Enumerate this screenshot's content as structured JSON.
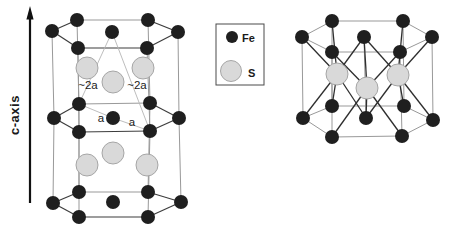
{
  "figure": {
    "canvas": {
      "width": 452,
      "height": 231,
      "background": "#ffffff"
    },
    "colors": {
      "fe_fill": "#1f1f1f",
      "s_fill": "#d9d9d9",
      "s_stroke": "#a6a6a6",
      "bond_dark": "#3d3d3d",
      "bond_gray": "#999999",
      "bond_thin": "#b5b5b5",
      "sbond_dark": "#2e2e2e",
      "arrow": "#111111",
      "text": "#1a1a1a",
      "legend_border": "#4a4a4a"
    },
    "radii": {
      "fe": 7,
      "s": 11,
      "legend_fe": 6,
      "legend_s": 10.5
    },
    "axis": {
      "label": "c-axis"
    },
    "annotations": [
      {
        "text": "~2a"
      },
      {
        "text": "~2a"
      },
      {
        "text": "a"
      },
      {
        "text": "a"
      }
    ],
    "legend": {
      "items": [
        {
          "label": "Fe",
          "element": "fe"
        },
        {
          "label": "S",
          "element": "s"
        }
      ]
    },
    "left_structure": {
      "atoms": [
        {
          "id": "t-bl",
          "el": "fe",
          "x": 77,
          "y": 20
        },
        {
          "id": "t-br",
          "el": "fe",
          "x": 148,
          "y": 20
        },
        {
          "id": "t-l",
          "el": "fe",
          "x": 52,
          "y": 31
        },
        {
          "id": "t-c",
          "el": "fe",
          "x": 112,
          "y": 32
        },
        {
          "id": "t-r",
          "el": "fe",
          "x": 178,
          "y": 32
        },
        {
          "id": "t-fl",
          "el": "fe",
          "x": 78,
          "y": 48
        },
        {
          "id": "t-fr",
          "el": "fe",
          "x": 147,
          "y": 48
        },
        {
          "id": "s1-l",
          "el": "s",
          "x": 87,
          "y": 68
        },
        {
          "id": "s1-r",
          "el": "s",
          "x": 143,
          "y": 68
        },
        {
          "id": "s1-c",
          "el": "s",
          "x": 113,
          "y": 82
        },
        {
          "id": "m-bl",
          "el": "fe",
          "x": 79,
          "y": 104
        },
        {
          "id": "m-br",
          "el": "fe",
          "x": 150,
          "y": 103
        },
        {
          "id": "m-l",
          "el": "fe",
          "x": 54,
          "y": 118
        },
        {
          "id": "m-c",
          "el": "fe",
          "x": 113,
          "y": 118
        },
        {
          "id": "m-r",
          "el": "fe",
          "x": 179,
          "y": 118
        },
        {
          "id": "m-fl",
          "el": "fe",
          "x": 79,
          "y": 132
        },
        {
          "id": "m-fr",
          "el": "fe",
          "x": 150,
          "y": 131
        },
        {
          "id": "s2-c",
          "el": "s",
          "x": 113,
          "y": 153
        },
        {
          "id": "s2-l",
          "el": "s",
          "x": 87,
          "y": 165
        },
        {
          "id": "s2-r",
          "el": "s",
          "x": 147,
          "y": 165
        },
        {
          "id": "b-bl",
          "el": "fe",
          "x": 79,
          "y": 192
        },
        {
          "id": "b-br",
          "el": "fe",
          "x": 148,
          "y": 192
        },
        {
          "id": "b-l",
          "el": "fe",
          "x": 53,
          "y": 203
        },
        {
          "id": "b-c",
          "el": "fe",
          "x": 113,
          "y": 202
        },
        {
          "id": "b-r",
          "el": "fe",
          "x": 181,
          "y": 202
        },
        {
          "id": "b-fl",
          "el": "fe",
          "x": 79,
          "y": 217
        },
        {
          "id": "b-fr",
          "el": "fe",
          "x": 148,
          "y": 217
        }
      ],
      "bonds": [
        {
          "a": "t-l",
          "b": "t-bl",
          "tone": "dark"
        },
        {
          "a": "t-bl",
          "b": "t-br",
          "tone": "gray"
        },
        {
          "a": "t-br",
          "b": "t-r",
          "tone": "dark"
        },
        {
          "a": "t-r",
          "b": "t-fr",
          "tone": "dark"
        },
        {
          "a": "t-fr",
          "b": "t-fl",
          "tone": "dark"
        },
        {
          "a": "t-fl",
          "b": "t-l",
          "tone": "dark"
        },
        {
          "a": "m-l",
          "b": "m-bl",
          "tone": "dark"
        },
        {
          "a": "m-bl",
          "b": "m-br",
          "tone": "gray"
        },
        {
          "a": "m-br",
          "b": "m-r",
          "tone": "dark"
        },
        {
          "a": "m-r",
          "b": "m-fr",
          "tone": "dark"
        },
        {
          "a": "m-fr",
          "b": "m-fl",
          "tone": "dark"
        },
        {
          "a": "m-fl",
          "b": "m-l",
          "tone": "dark"
        },
        {
          "a": "b-l",
          "b": "b-bl",
          "tone": "dark"
        },
        {
          "a": "b-bl",
          "b": "b-br",
          "tone": "gray"
        },
        {
          "a": "b-br",
          "b": "b-r",
          "tone": "dark"
        },
        {
          "a": "b-r",
          "b": "b-fr",
          "tone": "dark"
        },
        {
          "a": "b-fr",
          "b": "b-fl",
          "tone": "dark"
        },
        {
          "a": "b-fl",
          "b": "b-l",
          "tone": "dark"
        },
        {
          "a": "t-l",
          "b": "m-l",
          "tone": "gray"
        },
        {
          "a": "m-l",
          "b": "b-l",
          "tone": "gray"
        },
        {
          "a": "t-bl",
          "b": "m-bl",
          "tone": "gray"
        },
        {
          "a": "m-bl",
          "b": "b-bl",
          "tone": "gray"
        },
        {
          "a": "t-br",
          "b": "m-br",
          "tone": "gray"
        },
        {
          "a": "m-br",
          "b": "b-br",
          "tone": "gray"
        },
        {
          "a": "t-r",
          "b": "m-r",
          "tone": "gray"
        },
        {
          "a": "m-r",
          "b": "b-r",
          "tone": "gray"
        },
        {
          "a": "t-fl",
          "b": "m-fl",
          "tone": "gray"
        },
        {
          "a": "m-fl",
          "b": "b-fl",
          "tone": "gray"
        },
        {
          "a": "t-fr",
          "b": "m-fr",
          "tone": "gray"
        },
        {
          "a": "m-fr",
          "b": "b-fr",
          "tone": "gray"
        },
        {
          "a": "t-c",
          "b": "m-bl",
          "tone": "thin"
        },
        {
          "a": "t-c",
          "b": "m-fr",
          "tone": "thin"
        },
        {
          "a": "m-bl",
          "b": "m-c",
          "tone": "thin"
        },
        {
          "a": "m-c",
          "b": "m-fr",
          "tone": "thin"
        }
      ]
    },
    "right_structure": {
      "atoms": [
        {
          "id": "rt-bl",
          "el": "fe",
          "x": 332,
          "y": 21
        },
        {
          "id": "rt-br",
          "el": "fe",
          "x": 403,
          "y": 21
        },
        {
          "id": "rt-l",
          "el": "fe",
          "x": 302,
          "y": 37
        },
        {
          "id": "rt-c",
          "el": "fe",
          "x": 364,
          "y": 37
        },
        {
          "id": "rt-r",
          "el": "fe",
          "x": 432,
          "y": 37
        },
        {
          "id": "rt-fl",
          "el": "fe",
          "x": 332,
          "y": 52
        },
        {
          "id": "rt-fr",
          "el": "fe",
          "x": 400,
          "y": 52
        },
        {
          "id": "rs-l",
          "el": "s",
          "x": 337,
          "y": 74
        },
        {
          "id": "rs-c",
          "el": "s",
          "x": 367,
          "y": 88
        },
        {
          "id": "rs-r",
          "el": "s",
          "x": 398,
          "y": 75
        },
        {
          "id": "rb-bl",
          "el": "fe",
          "x": 332,
          "y": 106
        },
        {
          "id": "rb-br",
          "el": "fe",
          "x": 404,
          "y": 106
        },
        {
          "id": "rb-l",
          "el": "fe",
          "x": 303,
          "y": 118
        },
        {
          "id": "rb-c",
          "el": "fe",
          "x": 366,
          "y": 118
        },
        {
          "id": "rb-r",
          "el": "fe",
          "x": 433,
          "y": 120
        },
        {
          "id": "rb-fl",
          "el": "fe",
          "x": 332,
          "y": 137
        },
        {
          "id": "rb-fr",
          "el": "fe",
          "x": 402,
          "y": 136
        }
      ],
      "bonds": [
        {
          "a": "rt-l",
          "b": "rt-bl",
          "tone": "gray"
        },
        {
          "a": "rt-bl",
          "b": "rt-br",
          "tone": "gray"
        },
        {
          "a": "rt-br",
          "b": "rt-r",
          "tone": "gray"
        },
        {
          "a": "rt-r",
          "b": "rt-fr",
          "tone": "gray"
        },
        {
          "a": "rt-fr",
          "b": "rt-fl",
          "tone": "gray"
        },
        {
          "a": "rt-fl",
          "b": "rt-l",
          "tone": "gray"
        },
        {
          "a": "rb-l",
          "b": "rb-bl",
          "tone": "gray"
        },
        {
          "a": "rb-bl",
          "b": "rb-br",
          "tone": "gray"
        },
        {
          "a": "rb-br",
          "b": "rb-r",
          "tone": "gray"
        },
        {
          "a": "rb-r",
          "b": "rb-fr",
          "tone": "gray"
        },
        {
          "a": "rb-fr",
          "b": "rb-fl",
          "tone": "gray"
        },
        {
          "a": "rb-fl",
          "b": "rb-l",
          "tone": "gray"
        },
        {
          "a": "rt-l",
          "b": "rb-l",
          "tone": "gray"
        },
        {
          "a": "rt-bl",
          "b": "rb-bl",
          "tone": "gray"
        },
        {
          "a": "rt-br",
          "b": "rb-br",
          "tone": "gray"
        },
        {
          "a": "rt-r",
          "b": "rb-r",
          "tone": "gray"
        },
        {
          "a": "rt-fl",
          "b": "rb-fl",
          "tone": "gray"
        },
        {
          "a": "rt-fr",
          "b": "rb-fr",
          "tone": "gray"
        },
        {
          "a": "rt-c",
          "b": "rb-c",
          "tone": "gray"
        },
        {
          "a": "rs-l",
          "b": "rt-l",
          "tone": "sdark"
        },
        {
          "a": "rs-l",
          "b": "rt-bl",
          "tone": "sdark"
        },
        {
          "a": "rs-l",
          "b": "rt-c",
          "tone": "sdark"
        },
        {
          "a": "rs-l",
          "b": "rb-l",
          "tone": "sdark"
        },
        {
          "a": "rs-l",
          "b": "rb-bl",
          "tone": "sdark"
        },
        {
          "a": "rs-l",
          "b": "rb-c",
          "tone": "sdark"
        },
        {
          "a": "rs-r",
          "b": "rt-br",
          "tone": "sdark"
        },
        {
          "a": "rs-r",
          "b": "rt-r",
          "tone": "sdark"
        },
        {
          "a": "rs-r",
          "b": "rt-c",
          "tone": "sdark"
        },
        {
          "a": "rs-r",
          "b": "rb-br",
          "tone": "sdark"
        },
        {
          "a": "rs-r",
          "b": "rb-r",
          "tone": "sdark"
        },
        {
          "a": "rs-r",
          "b": "rb-c",
          "tone": "sdark"
        },
        {
          "a": "rs-c",
          "b": "rt-fl",
          "tone": "sdark"
        },
        {
          "a": "rs-c",
          "b": "rt-fr",
          "tone": "sdark"
        },
        {
          "a": "rs-c",
          "b": "rt-c",
          "tone": "sdark"
        },
        {
          "a": "rs-c",
          "b": "rb-fl",
          "tone": "sdark"
        },
        {
          "a": "rs-c",
          "b": "rb-fr",
          "tone": "sdark"
        },
        {
          "a": "rs-c",
          "b": "rb-c",
          "tone": "sdark"
        }
      ]
    }
  }
}
